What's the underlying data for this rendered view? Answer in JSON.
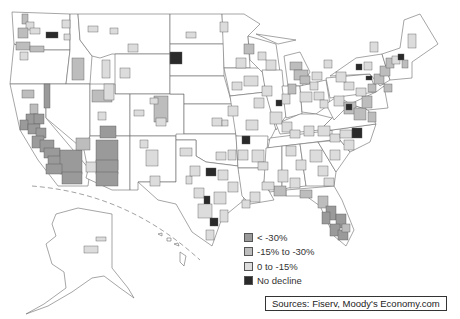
{
  "map": {
    "title": "",
    "region": "United States metro areas",
    "classes": [
      {
        "id": "lt30",
        "label": "< -30%",
        "color": "#9a9a9a"
      },
      {
        "id": "15to30",
        "label": "-15% to -30%",
        "color": "#bdbdbd"
      },
      {
        "id": "0to15",
        "label": "0 to -15%",
        "color": "#dcdcdc"
      },
      {
        "id": "none",
        "label": "No decline",
        "color": "#2a2a2a"
      }
    ],
    "insets": [
      "Alaska",
      "Hawaii"
    ],
    "notable_regions": [
      {
        "name": "California",
        "class": "lt30"
      },
      {
        "name": "Nevada (Las Vegas)",
        "class": "lt30"
      },
      {
        "name": "Arizona (Phoenix)",
        "class": "lt30"
      },
      {
        "name": "Florida",
        "class": "lt30"
      },
      {
        "name": "Northeast corridor",
        "class": "15to30"
      },
      {
        "name": "Michigan",
        "class": "15to30"
      },
      {
        "name": "Texas metros",
        "class": "0to15"
      },
      {
        "name": "North Dakota (Bismarck)",
        "class": "none"
      },
      {
        "name": "Washington (Wenatchee)",
        "class": "none"
      }
    ]
  },
  "legend": {
    "items": [
      {
        "label": "< -30%",
        "color": "#9a9a9a"
      },
      {
        "label": "-15% to -30%",
        "color": "#bdbdbd"
      },
      {
        "label": "0 to -15%",
        "color": "#dcdcdc"
      },
      {
        "label": "No decline",
        "color": "#2a2a2a"
      }
    ]
  },
  "sources": {
    "text": "Sources:  Fiserv, Moody's Economy.com"
  }
}
